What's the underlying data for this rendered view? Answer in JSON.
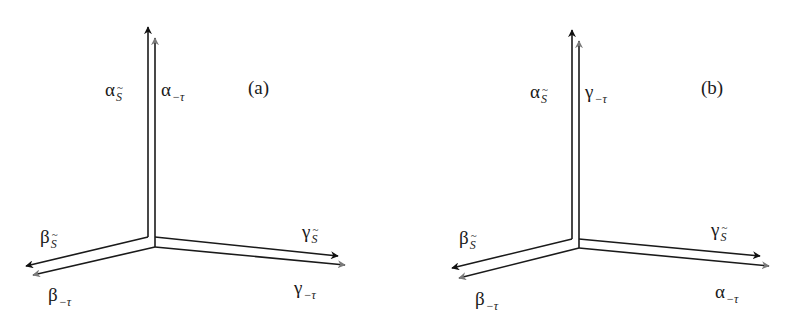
{
  "figure": {
    "panels": [
      {
        "id": "a",
        "tag": "(a)",
        "origin": {
          "xL": 148,
          "xR": 155,
          "yTop": 237,
          "yBot": 247
        },
        "vertical": {
          "black_label": {
            "symbol": "α",
            "sub": "S"
          },
          "gray_label": {
            "symbol": "α",
            "sub": "−τ"
          }
        },
        "left": {
          "black_label": {
            "symbol": "β",
            "sub": "S"
          },
          "gray_label": {
            "symbol": "β",
            "sub": "−τ"
          }
        },
        "right": {
          "black_label": {
            "symbol": "γ",
            "sub": "S"
          },
          "gray_label": {
            "symbol": "γ",
            "sub": "−τ"
          }
        }
      },
      {
        "id": "b",
        "tag": "(b)",
        "origin": {
          "xL": 572,
          "xR": 579,
          "yTop": 239,
          "yBot": 248
        },
        "vertical": {
          "black_label": {
            "symbol": "α",
            "sub": "S"
          },
          "gray_label": {
            "symbol": "γ",
            "sub": "−τ"
          }
        },
        "left": {
          "black_label": {
            "symbol": "β",
            "sub": "S"
          },
          "gray_label": {
            "symbol": "β",
            "sub": "−τ"
          }
        },
        "right": {
          "black_label": {
            "symbol": "γ",
            "sub": "S"
          },
          "gray_label": {
            "symbol": "α",
            "sub": "−τ"
          }
        }
      }
    ],
    "colors": {
      "black_arrow": "#111111",
      "gray_arrow": "#7a7a7a",
      "line": "#1a1a1a"
    }
  }
}
